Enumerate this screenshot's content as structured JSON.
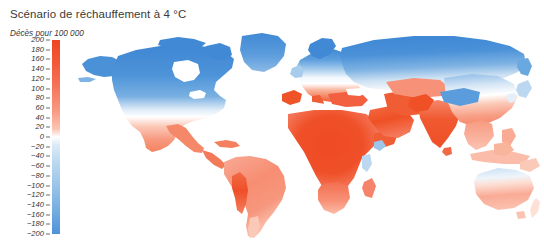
{
  "title": "Scénario de réchauffement à 4 °C",
  "subtitle": "Décès pour 100 000",
  "legend": {
    "unit_label": "Décès pour 100 000",
    "max": 200,
    "min": -200,
    "tick_step": 20,
    "ticks": [
      "200",
      "180",
      "160",
      "140",
      "120",
      "100",
      "80",
      "60",
      "40",
      "20",
      "0",
      "−20",
      "−40",
      "−60",
      "−80",
      "−100",
      "−120",
      "−140",
      "−160",
      "−180",
      "−200"
    ],
    "tick_values": [
      200,
      180,
      160,
      140,
      120,
      100,
      80,
      60,
      40,
      20,
      0,
      -20,
      -40,
      -60,
      -80,
      -100,
      -120,
      -140,
      -160,
      -180,
      -200
    ],
    "color_high": "#ee4520",
    "color_mid": "#ffffff",
    "color_low": "#4d93d9",
    "orientation": "vertical"
  },
  "chart_data": {
    "type": "heatmap",
    "title": "Scénario de réchauffement à 4 °C",
    "subtitle": "Décès pour 100 000",
    "xlabel": "",
    "ylabel": "",
    "value_label": "Décès pour 100 000",
    "projection": "world-choropleth",
    "colorscale": [
      {
        "value": -200,
        "color": "#4d93d9"
      },
      {
        "value": -100,
        "color": "#8fbde8"
      },
      {
        "value": -40,
        "color": "#cfe2f4"
      },
      {
        "value": 0,
        "color": "#ffffff"
      },
      {
        "value": 40,
        "color": "#fbcdbd"
      },
      {
        "value": 100,
        "color": "#f79077"
      },
      {
        "value": 200,
        "color": "#ee4520"
      }
    ],
    "zlim": [
      -200,
      200
    ],
    "legend_position": "left",
    "grid": false,
    "regions": [
      {
        "name": "Greenland",
        "value": -175
      },
      {
        "name": "Canada nord",
        "value": -190
      },
      {
        "name": "Alaska",
        "value": -165
      },
      {
        "name": "Canada sud",
        "value": -120
      },
      {
        "name": "États-Unis nord",
        "value": -30
      },
      {
        "name": "États-Unis sud",
        "value": 55
      },
      {
        "name": "Mexique",
        "value": 75
      },
      {
        "name": "Amérique centrale",
        "value": 85
      },
      {
        "name": "Caraïbes",
        "value": 90
      },
      {
        "name": "Brésil",
        "value": 70
      },
      {
        "name": "Amazonie",
        "value": 60
      },
      {
        "name": "Andes / Bolivie",
        "value": 150
      },
      {
        "name": "Argentine",
        "value": 45
      },
      {
        "name": "Chili sud",
        "value": -20
      },
      {
        "name": "Scandinavie",
        "value": -185
      },
      {
        "name": "Royaume-Uni",
        "value": -60
      },
      {
        "name": "Europe centrale",
        "value": 10
      },
      {
        "name": "Espagne",
        "value": 110
      },
      {
        "name": "Italie",
        "value": 95
      },
      {
        "name": "Balkans",
        "value": 85
      },
      {
        "name": "Turquie",
        "value": 100
      },
      {
        "name": "Russie nord",
        "value": -190
      },
      {
        "name": "Sibérie",
        "value": -180
      },
      {
        "name": "Russie sud",
        "value": -80
      },
      {
        "name": "Asie centrale",
        "value": 70
      },
      {
        "name": "Afrique du Nord",
        "value": 175
      },
      {
        "name": "Sahel",
        "value": 195
      },
      {
        "name": "Afrique de l'Ouest",
        "value": 190
      },
      {
        "name": "Afrique centrale",
        "value": 185
      },
      {
        "name": "Corne de l'Afrique",
        "value": 160
      },
      {
        "name": "Hauts plateaux éthiopiens",
        "value": -50
      },
      {
        "name": "Afrique de l'Est",
        "value": 120
      },
      {
        "name": "Afrique australe",
        "value": 95
      },
      {
        "name": "Madagascar",
        "value": 105
      },
      {
        "name": "Péninsule arabique",
        "value": 180
      },
      {
        "name": "Iran",
        "value": 150
      },
      {
        "name": "Inde",
        "value": 165
      },
      {
        "name": "Pakistan",
        "value": 170
      },
      {
        "name": "Plateau tibétain",
        "value": -120
      },
      {
        "name": "Chine nord",
        "value": -25
      },
      {
        "name": "Chine sud",
        "value": 60
      },
      {
        "name": "Japon",
        "value": -35
      },
      {
        "name": "Asie du Sud-Est",
        "value": 75
      },
      {
        "name": "Indonésie",
        "value": 55
      },
      {
        "name": "Australie nord",
        "value": -30
      },
      {
        "name": "Australie sud",
        "value": 60
      },
      {
        "name": "Nouvelle-Zélande",
        "value": 20
      }
    ]
  }
}
